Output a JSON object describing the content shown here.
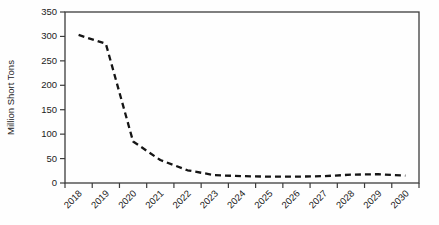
{
  "chart_data": {
    "type": "line",
    "title": "",
    "xlabel": "",
    "ylabel": "Million Short Tons",
    "categories": [
      "2018",
      "2019",
      "2020",
      "2021",
      "2022",
      "2023",
      "2024",
      "2025",
      "2026",
      "2027",
      "2028",
      "2029",
      "2030"
    ],
    "series": [
      {
        "name": "projection",
        "line_style": "dashed",
        "color": "#151515",
        "values": [
          303,
          285,
          85,
          47,
          26,
          16,
          14,
          13,
          13,
          14,
          17,
          18,
          15
        ]
      }
    ],
    "ylim": [
      0,
      350
    ],
    "y_ticks": [
      0,
      50,
      100,
      150,
      200,
      250,
      300,
      350
    ],
    "grid": false,
    "legend": "none",
    "plot_border": true,
    "x_tick_label_rotation_deg": -45,
    "colors": {
      "line": "#151515",
      "axis": "#3c3c3c",
      "text": "#222222",
      "background": "#fefefe"
    }
  }
}
